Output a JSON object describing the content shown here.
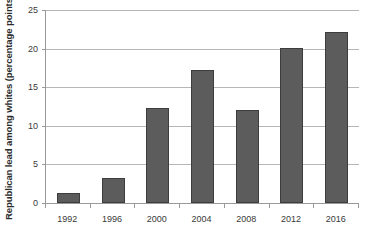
{
  "chart_data": {
    "type": "bar",
    "title": "",
    "xlabel": "",
    "ylabel": "Republican lead among whites (percentage points)",
    "categories": [
      "1992",
      "1996",
      "2000",
      "2004",
      "2008",
      "2012",
      "2016"
    ],
    "values": [
      1.3,
      3.3,
      12.3,
      17.2,
      12.0,
      20.1,
      22.2
    ],
    "ylim": [
      0,
      25
    ],
    "yticks": [
      0,
      5,
      10,
      15,
      20,
      25
    ],
    "ytick_labels": [
      "0",
      "5",
      "10",
      "15",
      "20",
      "25"
    ],
    "grid": true,
    "legend": false,
    "legend_position": "none",
    "bar_color": "#5c5c5c",
    "bar_border_color": "#3d3d3d",
    "gridline_color": "#b6b6b6",
    "axis_color": "#9a9a9a",
    "background_color": "#ffffff"
  }
}
